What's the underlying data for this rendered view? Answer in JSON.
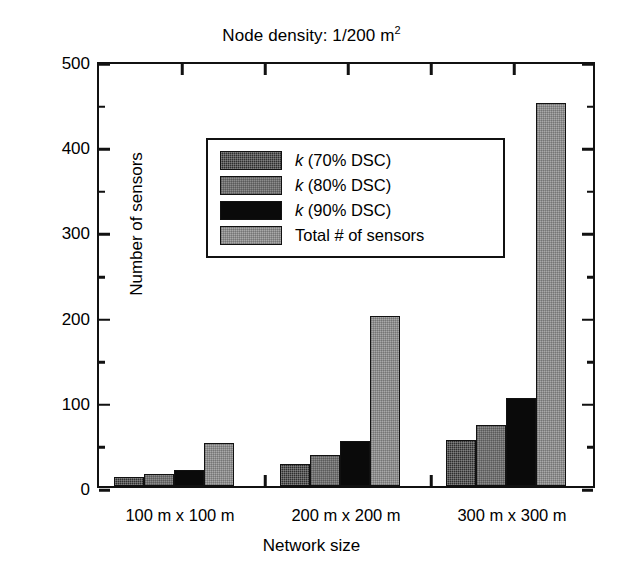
{
  "chart_data": {
    "type": "bar",
    "title": "Node density: 1/200 m",
    "title_sup": "2",
    "xlabel": "Network size",
    "ylabel": "Number of sensors",
    "categories": [
      "100 m x 100 m",
      "200 m x 200 m",
      "300 m x 300 m"
    ],
    "series": [
      {
        "name": "k (70% DSC)",
        "key": "k70",
        "values": [
          10,
          26,
          54
        ]
      },
      {
        "name": "k (80% DSC)",
        "key": "k80",
        "values": [
          14,
          36,
          72
        ]
      },
      {
        "name": "k (90% DSC)",
        "key": "k90",
        "values": [
          19,
          53,
          103
        ]
      },
      {
        "name": "Total # of sensors",
        "key": "tot",
        "values": [
          50,
          200,
          450
        ]
      }
    ],
    "ylim": [
      0,
      500
    ],
    "yticks": [
      0,
      100,
      200,
      300,
      400,
      500
    ],
    "yticks_minor": [
      50,
      150,
      250,
      350,
      450
    ],
    "grid": false,
    "legend_position": "upper left"
  },
  "legend": {
    "items": [
      {
        "label_italic": "k",
        "label_rest": " (70% DSC)",
        "fill": "k70"
      },
      {
        "label_italic": "k",
        "label_rest": " (80% DSC)",
        "fill": "k80"
      },
      {
        "label_italic": "k",
        "label_rest": " (90% DSC)",
        "fill": "k90"
      },
      {
        "label_italic": "",
        "label_rest": "Total # of sensors",
        "fill": "tot"
      }
    ]
  },
  "axis_labels": {
    "y0": "0",
    "y100": "100",
    "y200": "200",
    "y300": "300",
    "y400": "400",
    "y500": "500"
  }
}
